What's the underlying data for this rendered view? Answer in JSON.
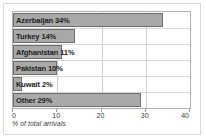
{
  "chart_data": {
    "type": "bar",
    "orientation": "horizontal",
    "title": "",
    "xlabel": "% of total arrivals",
    "ylabel": "",
    "xlim": [
      0,
      40
    ],
    "xticks": [
      0,
      10,
      20,
      30,
      40
    ],
    "grid": true,
    "legend": false,
    "categories": [
      "Azerbaijan",
      "Turkey",
      "Afghanistan",
      "Pakistan",
      "Kuwait",
      "Other"
    ],
    "values": [
      34,
      14,
      11,
      10,
      2,
      29
    ],
    "bar_labels": [
      "Azerbaijan 34%",
      "Turkey 14%",
      "Afghanistan 11%",
      "Pakistan 10%",
      "Kuwait 2%",
      "Other 29%"
    ],
    "colors": {
      "bar_fill": "#a9a9a9",
      "bar_border": "#6e6e6e",
      "grid": "#d0d0d0",
      "plot_border": "#b0b0b0",
      "text": "#1a1a1a",
      "background": "#ffffff"
    }
  }
}
